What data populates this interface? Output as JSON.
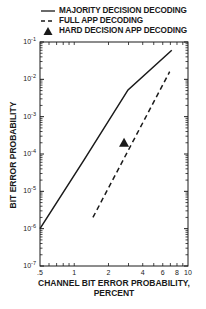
{
  "chart_data": {
    "type": "line",
    "title": "",
    "xlabel": "CHANNEL BIT ERROR PROBABILITY, PERCENT",
    "ylabel": "BIT ERROR PROBABILITY",
    "xscale": "log",
    "yscale": "log",
    "xlim": [
      0.5,
      10
    ],
    "ylim": [
      1e-07,
      0.1
    ],
    "x_ticks": [
      ".5",
      "1",
      "2",
      "4",
      "6",
      "8",
      "10"
    ],
    "y_ticks": [
      "10^-1",
      "10^-2",
      "10^-3",
      "10^-4",
      "10^-5",
      "10^-6",
      "10^-7"
    ],
    "grid": false,
    "legend_position": "top",
    "series": [
      {
        "name": "MAJORITY DECISION DECODING",
        "style": "solid",
        "x": [
          0.5,
          1.22,
          2.97,
          7.2
        ],
        "y": [
          1e-06,
          7e-05,
          0.0052,
          0.06
        ]
      },
      {
        "name": "FULL APP DECODING",
        "style": "dashed",
        "x": [
          1.46,
          6.9
        ],
        "y": [
          2e-06,
          0.016
        ]
      },
      {
        "name": "HARD DECISION APP DECODING",
        "style": "marker-triangle",
        "x": [
          2.74
        ],
        "y": [
          0.0002
        ]
      }
    ]
  },
  "legend": {
    "items": [
      {
        "label": "MAJORITY DECISION DECODING"
      },
      {
        "label": "FULL APP DECODING"
      },
      {
        "label": "HARD DECISION APP DECODING"
      }
    ]
  },
  "axes": {
    "xlabel_line1": "CHANNEL BIT ERROR PROBABILITY,",
    "xlabel_line2": "PERCENT",
    "ylabel": "BIT ERROR PROBABILITY"
  }
}
